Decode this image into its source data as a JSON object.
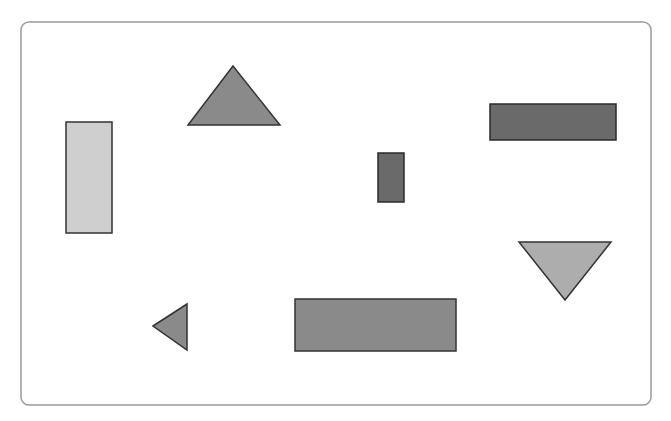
{
  "canvas": {
    "width": 671,
    "height": 421,
    "background": "#ffffff"
  },
  "frame": {
    "x": 21,
    "y": 22,
    "width": 630,
    "height": 383,
    "radius": 8,
    "stroke": "#9a9a9a",
    "fill": "#ffffff"
  },
  "shapes": [
    {
      "name": "tall-light-rectangle",
      "type": "rect",
      "x": 66,
      "y": 122,
      "width": 46,
      "height": 111,
      "fill": "#cfcfcf",
      "stroke": "#333333"
    },
    {
      "name": "top-triangle",
      "type": "polygon",
      "points": "233,66 188,125 280,125",
      "fill": "#8a8a8a",
      "stroke": "#333333"
    },
    {
      "name": "dark-wide-rectangle",
      "type": "rect",
      "x": 490,
      "y": 104,
      "width": 126,
      "height": 36,
      "fill": "#6a6a6a",
      "stroke": "#2a2a2a"
    },
    {
      "name": "small-dark-rectangle",
      "type": "rect",
      "x": 378,
      "y": 153,
      "width": 26,
      "height": 49,
      "fill": "#6a6a6a",
      "stroke": "#2a2a2a"
    },
    {
      "name": "down-triangle",
      "type": "polygon",
      "points": "519,242 611,242 565,300",
      "fill": "#adadad",
      "stroke": "#333333"
    },
    {
      "name": "wide-mid-rectangle",
      "type": "rect",
      "x": 295,
      "y": 299,
      "width": 161,
      "height": 52,
      "fill": "#8a8a8a",
      "stroke": "#333333"
    },
    {
      "name": "left-triangle",
      "type": "polygon",
      "points": "153,326 187,304 187,350",
      "fill": "#8a8a8a",
      "stroke": "#333333"
    }
  ]
}
